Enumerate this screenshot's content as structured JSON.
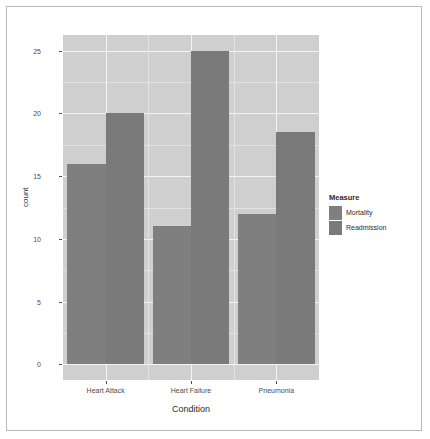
{
  "chart_data": {
    "type": "bar",
    "title": "",
    "subtitle": "",
    "xlabel": "Condition",
    "ylabel": "count",
    "categories": [
      "Heart Attack",
      "Heart Failure",
      "Pneumonia"
    ],
    "series": [
      {
        "name": "Mortality",
        "values": [
          16,
          11,
          12
        ],
        "color": "#7f7f7f"
      },
      {
        "name": "Readmission",
        "values": [
          20,
          25,
          18.5
        ],
        "color": "#7a7a7a"
      }
    ],
    "legend": {
      "title": "Measure",
      "position": "right",
      "entries": [
        "Mortality",
        "Readmission"
      ]
    },
    "yaxis": {
      "ticks": [
        0,
        5,
        10,
        15,
        20,
        25
      ],
      "tick_labels": [
        "0",
        "5",
        "10",
        "15",
        "20",
        "25"
      ],
      "ylim": [
        -1.25,
        26.25
      ]
    },
    "xaxis": {
      "tick_labels": [
        "Heart Attack",
        "Heart Failure",
        "Pneumonia"
      ]
    },
    "grid": {
      "major_color": "#f4f4f4",
      "minor_color": "#e2e2e2",
      "panel_background": "#cfcfcf",
      "show": true
    },
    "style": {
      "figure_background": "#ffffff",
      "border_color": "#b9b9b9",
      "text_color": "#4d4d4d"
    }
  }
}
